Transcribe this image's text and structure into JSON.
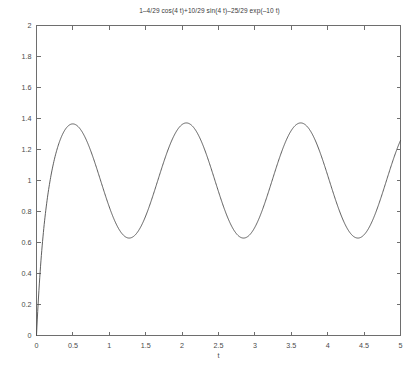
{
  "chart_data": {
    "type": "line",
    "title": "1–4/29 cos(4 t)+10/29 sin(4 t)–25/29 exp(–10 t)",
    "xlabel": "t",
    "ylabel": "",
    "xlim": [
      0,
      5
    ],
    "ylim": [
      0,
      2
    ],
    "grid": false,
    "legend": null,
    "formula": "1 - (4/29)*cos(4*t) + (10/29)*sin(4*t) - (25/29)*exp(-10*t)",
    "xticks": [
      0,
      0.5,
      1,
      1.5,
      2,
      2.5,
      3,
      3.5,
      4,
      4.5,
      5
    ],
    "xtick_labels": [
      "0",
      "0.5",
      "1",
      "1.5",
      "2",
      "2.5",
      "3",
      "3.5",
      "4",
      "4.5",
      "5"
    ],
    "yticks": [
      0,
      0.2,
      0.4,
      0.6,
      0.8,
      1,
      1.2,
      1.4,
      1.6,
      1.8,
      2
    ],
    "ytick_labels": [
      "0",
      "0.2",
      "0.4",
      "0.6",
      "0.8",
      "1",
      "1.2",
      "1.4",
      "1.6",
      "1.8",
      "2"
    ],
    "series": [
      {
        "name": "step response",
        "x": [
          0,
          0.05,
          0.1,
          0.15,
          0.2,
          0.25,
          0.3,
          0.35,
          0.4,
          0.45,
          0.5,
          0.55,
          0.6,
          0.65,
          0.7,
          0.75,
          0.8,
          0.85,
          0.9,
          0.95,
          1,
          1.1,
          1.2,
          1.3,
          1.4,
          1.5,
          1.6,
          1.7,
          1.8,
          1.9,
          2,
          2.1,
          2.2,
          2.3,
          2.4,
          2.5,
          2.6,
          2.7,
          2.8,
          2.9,
          3,
          3.1,
          3.2,
          3.3,
          3.4,
          3.5,
          3.6,
          3.7,
          3.8,
          3.9,
          4,
          4.1,
          4.2,
          4.3,
          4.4,
          4.5,
          4.6,
          4.7,
          4.8,
          4.9,
          5
        ],
        "y": [
          0,
          0.34,
          0.62,
          0.85,
          1.03,
          1.17,
          1.27,
          1.33,
          1.36,
          1.36,
          1.36,
          1.33,
          1.29,
          1.23,
          1.16,
          1.09,
          1.01,
          0.94,
          0.87,
          0.81,
          0.75,
          0.67,
          0.63,
          0.62,
          0.63,
          0.67,
          0.74,
          0.83,
          0.94,
          1.05,
          1.16,
          1.26,
          1.33,
          1.36,
          1.36,
          1.33,
          1.26,
          1.16,
          1.05,
          0.94,
          0.83,
          0.74,
          0.67,
          0.63,
          0.62,
          0.63,
          0.67,
          0.74,
          0.83,
          0.94,
          1.05,
          1.16,
          1.26,
          1.33,
          1.36,
          1.36,
          1.33,
          1.26,
          1.16,
          1.05,
          1.23
        ],
        "peaks": [
          {
            "t": 0.52,
            "value": 1.36
          },
          {
            "t": 2.09,
            "value": 1.36
          },
          {
            "t": 3.66,
            "value": 1.36
          }
        ],
        "troughs": [
          {
            "t": 1.29,
            "value": 0.62
          },
          {
            "t": 2.86,
            "value": 0.62
          },
          {
            "t": 4.43,
            "value": 0.62
          }
        ],
        "color": "#4d4d4d"
      }
    ]
  },
  "axes": {
    "x_axis_name": "t",
    "frame_color": "#6e6e6e",
    "background": "#ffffff"
  }
}
